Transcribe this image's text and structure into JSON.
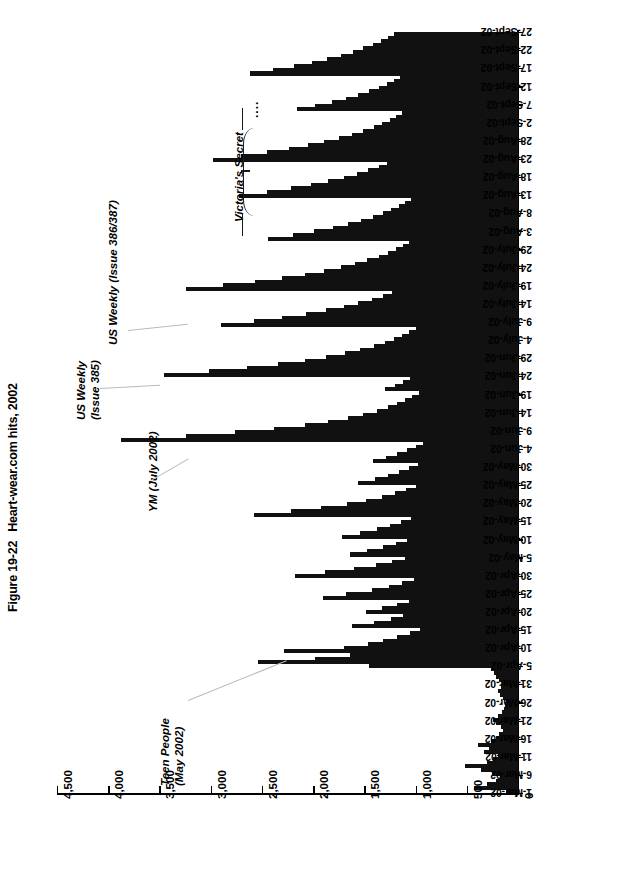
{
  "caption": {
    "figure_number": "Figure 19-22",
    "title": "Heart-wear.com hits, 2002"
  },
  "annotations": [
    {
      "id": "teen-people",
      "lines": [
        "Teen People",
        "(May 2002)"
      ]
    },
    {
      "id": "ym",
      "lines": [
        "YM (July 2002)"
      ]
    },
    {
      "id": "us-weekly-385",
      "lines": [
        "US Weekly",
        "(Issue 385)"
      ]
    },
    {
      "id": "us-weekly-386",
      "lines": [
        "US Weekly (Issue 386/387)"
      ]
    },
    {
      "id": "victorias-secret",
      "lines": [
        "Victoria's Secret"
      ],
      "ellipsis": "...."
    }
  ],
  "chart_data": {
    "type": "bar",
    "orientation": "horizontal-rotated",
    "title": "Heart-wear.com hits, 2002",
    "xlabel": "",
    "ylabel": "",
    "value_axis": {
      "tick_labels": [
        "4,500",
        "4,000",
        "3,500",
        "3,000",
        "2,500",
        "2,000",
        "1,500",
        "1,000",
        "500",
        "0"
      ],
      "tick_values": [
        4500,
        4000,
        3500,
        3000,
        2500,
        2000,
        1500,
        1000,
        500,
        0
      ],
      "min": 0,
      "max": 4500,
      "grid": false
    },
    "category_axis": {
      "tick_labels": [
        "27-Sept-02",
        "22-Sept-02",
        "17-Sept-02",
        "12-Sept-02",
        "7-Sept-02",
        "2-Sept-02",
        "28-Aug-02",
        "23-Aug-02",
        "18-Aug-02",
        "13-Aug-02",
        "8-Aug-02",
        "3-Aug-02",
        "29-July-02",
        "24-July-02",
        "19-July-02",
        "14-July-02",
        "9-July-02",
        "4-July-02",
        "29-Jun-02",
        "24-Jun-02",
        "19-Jun-02",
        "14-Jun-02",
        "9-Jun-02",
        "4-Jun-02",
        "30-May-02",
        "25-May-02",
        "20-May-02",
        "15-May-02",
        "10-May-02",
        "5-May-02",
        "30-Apr-02",
        "25-Apr-02",
        "20-Apr-02",
        "15-Apr-02",
        "10-Apr-02",
        "5-Apr-02",
        "31-Mar-02",
        "26-Mar-02",
        "21-Mar-02",
        "16-Mar-02",
        "11-Mar-02",
        "6-Mar-02",
        "1-Mar-02"
      ],
      "label_interval_days": 5,
      "order": "top-is-latest"
    },
    "series_name": "Daily hits",
    "start_date": "1-Mar-02",
    "end_date": "27-Sept-02",
    "values_order": "1-Mar-02 first (bottom) to 27-Sept-02 last (top), one value per day",
    "values": [
      120,
      430,
      300,
      210,
      180,
      250,
      360,
      520,
      300,
      240,
      200,
      330,
      280,
      390,
      260,
      210,
      190,
      150,
      170,
      210,
      240,
      200,
      160,
      140,
      130,
      120,
      150,
      180,
      200,
      170,
      160,
      190,
      210,
      230,
      260,
      1450,
      2540,
      1980,
      1640,
      2280,
      1700,
      1460,
      1320,
      1180,
      1050,
      960,
      1620,
      1410,
      1240,
      1120,
      1480,
      1330,
      1180,
      1060,
      1900,
      1680,
      1430,
      1260,
      1130,
      1020,
      2180,
      1880,
      1600,
      1390,
      1230,
      1100,
      1640,
      1470,
      1320,
      1190,
      1080,
      1720,
      1540,
      1380,
      1250,
      1140,
      1040,
      2580,
      2220,
      1920,
      1670,
      1480,
      1330,
      1200,
      1090,
      1000,
      1560,
      1400,
      1270,
      1160,
      1060,
      980,
      1420,
      1290,
      1180,
      1080,
      1000,
      930,
      3880,
      3240,
      2760,
      2380,
      2080,
      1850,
      1660,
      1510,
      1380,
      1270,
      1180,
      1100,
      1030,
      970,
      1300,
      1200,
      1120,
      1050,
      3460,
      3020,
      2650,
      2340,
      2080,
      1870,
      1690,
      1540,
      1410,
      1300,
      1210,
      1130,
      1060,
      1000,
      2900,
      2580,
      2300,
      2070,
      1870,
      1700,
      1560,
      1430,
      1320,
      1230,
      3240,
      2880,
      2570,
      2300,
      2080,
      1890,
      1730,
      1590,
      1470,
      1360,
      1270,
      1190,
      1120,
      1060,
      2440,
      2200,
      1990,
      1810,
      1660,
      1530,
      1420,
      1320,
      1240,
      1160,
      1100,
      1040,
      2720,
      2450,
      2220,
      2020,
      1850,
      1700,
      1570,
      1460,
      1360,
      1280,
      2980,
      2700,
      2450,
      2240,
      2050,
      1890,
      1750,
      1620,
      1510,
      1410,
      1330,
      1250,
      1190,
      1130,
      2160,
      1980,
      1820,
      1680,
      1560,
      1450,
      1360,
      1280,
      1210,
      1150,
      2620,
      2390,
      2190,
      2010,
      1860,
      1730,
      1610,
      1510,
      1420,
      1340,
      1270,
      1210
    ]
  }
}
